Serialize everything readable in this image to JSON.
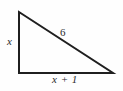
{
  "figure": {
    "name": "right-triangle-diagram",
    "type": "geometry-figure",
    "background_color": "#fefefe",
    "stroke_color": "#1f1f1f",
    "stroke_width": 2,
    "text_color": "#2b2b2b",
    "vertices": {
      "apex": {
        "x": 19,
        "y": 12
      },
      "bottom_left": {
        "x": 19,
        "y": 73
      },
      "bottom_right": {
        "x": 113,
        "y": 73
      }
    },
    "labels": {
      "leg_vertical": "x",
      "hypotenuse": "6",
      "leg_horizontal": "x + 1"
    }
  }
}
